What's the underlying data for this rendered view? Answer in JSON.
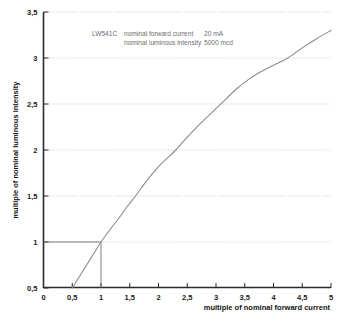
{
  "chart_data": {
    "type": "line",
    "title": "",
    "xlabel": "multiple of nominal forward current",
    "ylabel": "multiple of nominal luminous intensity",
    "xlim": [
      0,
      5
    ],
    "ylim": [
      0.5,
      3.5
    ],
    "grid": true,
    "legend": null,
    "decimal_separator": ",",
    "xticks": [
      "0",
      "0,5",
      "1",
      "1,5",
      "2",
      "2,5",
      "3",
      "3,5",
      "4",
      "4,5",
      "5"
    ],
    "xtick_values": [
      0,
      0.5,
      1,
      1.5,
      2,
      2.5,
      3,
      3.5,
      4,
      4.5,
      5
    ],
    "yticks": [
      "0,5",
      "1",
      "1,5",
      "2",
      "2,5",
      "3",
      "3,5"
    ],
    "ytick_values": [
      0.5,
      1,
      1.5,
      2,
      2.5,
      3,
      3.5
    ],
    "series": [
      {
        "name": "relative luminous intensity",
        "color": "#8c8c8c",
        "x": [
          0.5,
          0.6,
          0.7,
          0.8,
          0.9,
          1.0,
          1.15,
          1.3,
          1.45,
          1.6,
          1.8,
          2.0,
          2.15,
          2.3,
          2.5,
          2.7,
          2.9,
          3.15,
          3.35,
          3.55,
          3.75,
          4.0,
          4.25,
          4.5,
          4.75,
          5.0
        ],
        "y": [
          0.5,
          0.6,
          0.7,
          0.8,
          0.9,
          1.0,
          1.13,
          1.25,
          1.38,
          1.5,
          1.67,
          1.82,
          1.91,
          2.0,
          2.14,
          2.27,
          2.39,
          2.54,
          2.66,
          2.76,
          2.84,
          2.92,
          3.0,
          3.11,
          3.21,
          3.3
        ]
      }
    ],
    "reference_lines": {
      "name": "nominal operating point guide",
      "color": "#6e6e6e",
      "horizontal": {
        "y": 1,
        "x_from": 0,
        "x_to": 1
      },
      "vertical": {
        "x": 1,
        "y_from": 0.5,
        "y_to": 1
      }
    },
    "annotations": [
      {
        "name": "device-annotation-line-1",
        "text_part_a": "LW541C",
        "text_part_b": "nominal forward current",
        "text_part_c": "20 mA"
      },
      {
        "name": "device-annotation-line-2",
        "text_part_b": "nominal luminous intensity",
        "text_part_c": "5000 mcd"
      }
    ]
  },
  "annotation": {
    "part_number": "LW541C",
    "line1_label": "nominal forward current",
    "line1_value": "20 mA",
    "line2_label": "nominal luminous intensity",
    "line2_value": "5000 mcd"
  },
  "axes": {
    "x_title": "multiple of nominal forward current",
    "y_title": "multiple of nominal luminous intensity"
  }
}
